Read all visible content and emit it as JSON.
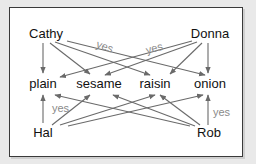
{
  "diagram": {
    "title": "",
    "colors": {
      "background": "#e9e9e9",
      "frame_fill": "#ffffff",
      "frame_border": "#3a3a3a",
      "edge": "#6a6a6a",
      "label": "#111111",
      "edge_label": "#8a8a8a"
    },
    "nodes": {
      "cathy": {
        "label": "Cathy",
        "x": 46,
        "y": 38
      },
      "donna": {
        "label": "Donna",
        "x": 210,
        "y": 38
      },
      "plain": {
        "label": "plain",
        "x": 43,
        "y": 88
      },
      "sesame": {
        "label": "sesame",
        "x": 99,
        "y": 88
      },
      "raisin": {
        "label": "raisin",
        "x": 155,
        "y": 88
      },
      "onion": {
        "label": "onion",
        "x": 210,
        "y": 88
      },
      "hal": {
        "label": "Hal",
        "x": 43,
        "y": 137
      },
      "rob": {
        "label": "Rob",
        "x": 209,
        "y": 137
      }
    },
    "edge_labels": {
      "cathy_raisin": "yes",
      "donna_plain": "yes",
      "hal_plain": "yes",
      "rob_onion": "yes"
    },
    "edges": [
      {
        "from": "Cathy",
        "to": "plain"
      },
      {
        "from": "Cathy",
        "to": "sesame"
      },
      {
        "from": "Cathy",
        "to": "raisin",
        "label": "yes"
      },
      {
        "from": "Cathy",
        "to": "onion"
      },
      {
        "from": "Donna",
        "to": "onion"
      },
      {
        "from": "Donna",
        "to": "raisin"
      },
      {
        "from": "Donna",
        "to": "sesame"
      },
      {
        "from": "Donna",
        "to": "plain",
        "label": "yes"
      },
      {
        "from": "Hal",
        "to": "plain",
        "label": "yes"
      },
      {
        "from": "Hal",
        "to": "sesame"
      },
      {
        "from": "Hal",
        "to": "raisin"
      },
      {
        "from": "Hal",
        "to": "onion"
      },
      {
        "from": "Rob",
        "to": "onion",
        "label": "yes"
      },
      {
        "from": "Rob",
        "to": "raisin"
      },
      {
        "from": "Rob",
        "to": "sesame"
      },
      {
        "from": "Rob",
        "to": "plain"
      }
    ]
  }
}
